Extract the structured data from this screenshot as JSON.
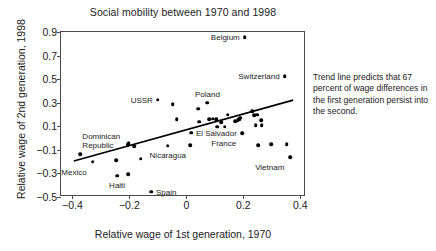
{
  "chart_data": {
    "type": "scatter",
    "title": "Social mobility between 1970 and 1998",
    "xlabel": "Relative wage of 1st generation, 1970",
    "ylabel": "Relative wage of 2nd generation, 1998",
    "xlim": [
      -0.44,
      0.42
    ],
    "ylim": [
      -0.5,
      0.9
    ],
    "xticks": [
      "-0.4",
      "-0.2",
      "0",
      "0.2",
      "0.4"
    ],
    "xtick_values": [
      -0.4,
      -0.2,
      0,
      0.2,
      0.4
    ],
    "yticks": [
      "0.9",
      "0.7",
      "0.5",
      "0.3",
      "0.1",
      "-0.1",
      "-0.3",
      "-0.5"
    ],
    "ytick_values": [
      0.9,
      0.7,
      0.5,
      0.3,
      0.1,
      -0.1,
      -0.3,
      -0.5
    ],
    "grid": false,
    "legend": false,
    "points": [
      {
        "x": -0.372,
        "y": -0.135,
        "label": "Dominican Republic",
        "label_pos": "above-left"
      },
      {
        "x": -0.329,
        "y": -0.2,
        "label": "Mexico",
        "label_pos": "below-left"
      },
      {
        "x": -0.243,
        "y": -0.32,
        "label": "Haiti",
        "label_pos": "below"
      },
      {
        "x": -0.246,
        "y": -0.19,
        "label": null
      },
      {
        "x": -0.205,
        "y": -0.305,
        "label": null
      },
      {
        "x": -0.206,
        "y": -0.06,
        "label": null
      },
      {
        "x": -0.204,
        "y": -0.048,
        "label": null
      },
      {
        "x": -0.202,
        "y": -0.038,
        "label": null
      },
      {
        "x": -0.184,
        "y": -0.068,
        "label": null
      },
      {
        "x": -0.16,
        "y": -0.175,
        "label": null
      },
      {
        "x": -0.124,
        "y": -0.455,
        "label": "Spain",
        "label_pos": "right"
      },
      {
        "x": -0.1,
        "y": 0.325,
        "label": "USSR",
        "label_pos": "left"
      },
      {
        "x": -0.065,
        "y": -0.065,
        "label": "Nicaragua",
        "label_pos": "below"
      },
      {
        "x": -0.048,
        "y": 0.288,
        "label": null
      },
      {
        "x": -0.034,
        "y": 0.158,
        "label": null
      },
      {
        "x": 0.013,
        "y": -0.06,
        "label": null
      },
      {
        "x": 0.016,
        "y": 0.045,
        "label": "El Salvador",
        "label_pos": "right"
      },
      {
        "x": 0.042,
        "y": 0.25,
        "label": null
      },
      {
        "x": 0.046,
        "y": 0.138,
        "label": null
      },
      {
        "x": 0.074,
        "y": 0.3,
        "label": "Poland",
        "label_pos": "above"
      },
      {
        "x": 0.08,
        "y": 0.158,
        "label": null
      },
      {
        "x": 0.092,
        "y": 0.163,
        "label": null
      },
      {
        "x": 0.104,
        "y": 0.16,
        "label": null
      },
      {
        "x": 0.108,
        "y": 0.098,
        "label": null
      },
      {
        "x": 0.122,
        "y": 0.137,
        "label": null
      },
      {
        "x": 0.134,
        "y": 0.098,
        "label": null
      },
      {
        "x": 0.145,
        "y": 0.198,
        "label": null
      },
      {
        "x": 0.172,
        "y": 0.142,
        "label": null
      },
      {
        "x": 0.18,
        "y": 0.152,
        "label": null
      },
      {
        "x": 0.186,
        "y": 0.16,
        "label": null
      },
      {
        "x": 0.19,
        "y": 0.172,
        "label": null
      },
      {
        "x": 0.205,
        "y": 0.855,
        "label": "Belgium",
        "label_pos": "left"
      },
      {
        "x": 0.196,
        "y": 0.04,
        "label": "France",
        "label_pos": "below-left"
      },
      {
        "x": 0.232,
        "y": 0.228,
        "label": null
      },
      {
        "x": 0.238,
        "y": 0.196,
        "label": null
      },
      {
        "x": 0.244,
        "y": 0.108,
        "label": null
      },
      {
        "x": 0.248,
        "y": 0.2,
        "label": null
      },
      {
        "x": 0.262,
        "y": 0.152,
        "label": null
      },
      {
        "x": 0.264,
        "y": 0.11,
        "label": null
      },
      {
        "x": 0.252,
        "y": -0.062,
        "label": null
      },
      {
        "x": 0.298,
        "y": -0.052,
        "label": null
      },
      {
        "x": 0.345,
        "y": 0.525,
        "label": "Switzerland",
        "label_pos": "left"
      },
      {
        "x": 0.352,
        "y": -0.05,
        "label": null
      },
      {
        "x": 0.365,
        "y": -0.16,
        "label": "Vietnam",
        "label_pos": "below-left"
      }
    ],
    "trendline": {
      "x0": -0.395,
      "y0": -0.195,
      "x1": 0.375,
      "y1": 0.322,
      "slope": 0.67,
      "description": "Trend line predicts that 67 percent of wage differences in the first generation persist into the second."
    }
  },
  "annotation": {
    "text": "Trend line predicts that 67 percent of wage differences in the first generation persist into the second."
  },
  "colors": {
    "point": "#000000",
    "frame": "#4a4a4a",
    "text": "#1a1a1a",
    "background": "#ffffff"
  }
}
